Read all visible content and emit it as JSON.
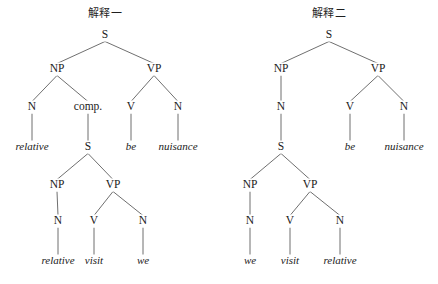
{
  "figure": {
    "background_color": "#ffffff",
    "line_color": "#4a4a4a",
    "text_color": "#1a1a1a",
    "width": 438,
    "height": 284
  },
  "trees": [
    {
      "id": "tree-left",
      "title": "解释一",
      "title_x": 105,
      "title_y": 17,
      "nodes": [
        {
          "id": "L-S",
          "label": "S",
          "kind": "node",
          "x": 105,
          "y": 38
        },
        {
          "id": "L-NP",
          "label": "NP",
          "kind": "node",
          "x": 57,
          "y": 72
        },
        {
          "id": "L-VP",
          "label": "VP",
          "kind": "node",
          "x": 154,
          "y": 72
        },
        {
          "id": "L-N1",
          "label": "N",
          "kind": "node",
          "x": 32,
          "y": 110
        },
        {
          "id": "L-COMP",
          "label": "comp.",
          "kind": "node",
          "x": 88,
          "y": 110
        },
        {
          "id": "L-V1",
          "label": "V",
          "kind": "node",
          "x": 131,
          "y": 110
        },
        {
          "id": "L-N2",
          "label": "N",
          "kind": "node",
          "x": 178,
          "y": 110
        },
        {
          "id": "L-W1",
          "label": "relative",
          "kind": "leaf",
          "x": 32,
          "y": 150
        },
        {
          "id": "L-S2",
          "label": "S",
          "kind": "node",
          "x": 88,
          "y": 150
        },
        {
          "id": "L-W2",
          "label": "be",
          "kind": "leaf",
          "x": 131,
          "y": 150
        },
        {
          "id": "L-W3",
          "label": "nuisance",
          "kind": "leaf",
          "x": 178,
          "y": 150
        },
        {
          "id": "L-NP2",
          "label": "NP",
          "kind": "node",
          "x": 57,
          "y": 188
        },
        {
          "id": "L-VP2",
          "label": "VP",
          "kind": "node",
          "x": 113,
          "y": 188
        },
        {
          "id": "L-N3",
          "label": "N",
          "kind": "node",
          "x": 58,
          "y": 224
        },
        {
          "id": "L-V2",
          "label": "V",
          "kind": "node",
          "x": 94,
          "y": 224
        },
        {
          "id": "L-N4",
          "label": "N",
          "kind": "node",
          "x": 143,
          "y": 224
        },
        {
          "id": "L-W4",
          "label": "relative",
          "kind": "leaf",
          "x": 58,
          "y": 264
        },
        {
          "id": "L-W5",
          "label": "visit",
          "kind": "leaf",
          "x": 94,
          "y": 264
        },
        {
          "id": "L-W6",
          "label": "we",
          "kind": "leaf",
          "x": 143,
          "y": 264
        }
      ],
      "edges": [
        [
          "L-S",
          "L-NP"
        ],
        [
          "L-S",
          "L-VP"
        ],
        [
          "L-NP",
          "L-N1"
        ],
        [
          "L-NP",
          "L-COMP"
        ],
        [
          "L-VP",
          "L-V1"
        ],
        [
          "L-VP",
          "L-N2"
        ],
        [
          "L-N1",
          "L-W1"
        ],
        [
          "L-COMP",
          "L-S2"
        ],
        [
          "L-V1",
          "L-W2"
        ],
        [
          "L-N2",
          "L-W3"
        ],
        [
          "L-S2",
          "L-NP2"
        ],
        [
          "L-S2",
          "L-VP2"
        ],
        [
          "L-NP2",
          "L-N3"
        ],
        [
          "L-VP2",
          "L-V2"
        ],
        [
          "L-VP2",
          "L-N4"
        ],
        [
          "L-N3",
          "L-W4"
        ],
        [
          "L-V2",
          "L-W5"
        ],
        [
          "L-N4",
          "L-W6"
        ]
      ],
      "terminal_string": "relative comp. [ relative visit we ] be nuisance"
    },
    {
      "id": "tree-right",
      "title": "解释二",
      "title_x": 329,
      "title_y": 17,
      "nodes": [
        {
          "id": "R-S",
          "label": "S",
          "kind": "node",
          "x": 329,
          "y": 38
        },
        {
          "id": "R-NP",
          "label": "NP",
          "kind": "node",
          "x": 281,
          "y": 72
        },
        {
          "id": "R-VP",
          "label": "VP",
          "kind": "node",
          "x": 378,
          "y": 72
        },
        {
          "id": "R-N1",
          "label": "N",
          "kind": "node",
          "x": 281,
          "y": 110
        },
        {
          "id": "R-V1",
          "label": "V",
          "kind": "node",
          "x": 350,
          "y": 110
        },
        {
          "id": "R-N2",
          "label": "N",
          "kind": "node",
          "x": 404,
          "y": 110
        },
        {
          "id": "R-S2",
          "label": "S",
          "kind": "node",
          "x": 281,
          "y": 150
        },
        {
          "id": "R-W2",
          "label": "be",
          "kind": "leaf",
          "x": 350,
          "y": 150
        },
        {
          "id": "R-W3",
          "label": "nuisance",
          "kind": "leaf",
          "x": 404,
          "y": 150
        },
        {
          "id": "R-NP2",
          "label": "NP",
          "kind": "node",
          "x": 250,
          "y": 188
        },
        {
          "id": "R-VP2",
          "label": "VP",
          "kind": "node",
          "x": 310,
          "y": 188
        },
        {
          "id": "R-N3",
          "label": "N",
          "kind": "node",
          "x": 250,
          "y": 224
        },
        {
          "id": "R-V2",
          "label": "V",
          "kind": "node",
          "x": 290,
          "y": 224
        },
        {
          "id": "R-N4",
          "label": "N",
          "kind": "node",
          "x": 340,
          "y": 224
        },
        {
          "id": "R-W4",
          "label": "we",
          "kind": "leaf",
          "x": 250,
          "y": 264
        },
        {
          "id": "R-W5",
          "label": "visit",
          "kind": "leaf",
          "x": 290,
          "y": 264
        },
        {
          "id": "R-W6",
          "label": "relative",
          "kind": "leaf",
          "x": 340,
          "y": 264
        }
      ],
      "edges": [
        [
          "R-S",
          "R-NP"
        ],
        [
          "R-S",
          "R-VP"
        ],
        [
          "R-NP",
          "R-N1"
        ],
        [
          "R-VP",
          "R-V1"
        ],
        [
          "R-VP",
          "R-N2"
        ],
        [
          "R-N1",
          "R-S2"
        ],
        [
          "R-V1",
          "R-W2"
        ],
        [
          "R-N2",
          "R-W3"
        ],
        [
          "R-S2",
          "R-NP2"
        ],
        [
          "R-S2",
          "R-VP2"
        ],
        [
          "R-NP2",
          "R-N3"
        ],
        [
          "R-VP2",
          "R-V2"
        ],
        [
          "R-VP2",
          "R-N4"
        ],
        [
          "R-N3",
          "R-W4"
        ],
        [
          "R-V2",
          "R-W5"
        ],
        [
          "R-N4",
          "R-W6"
        ]
      ],
      "terminal_string": "[ we visit relative ] be nuisance"
    }
  ]
}
